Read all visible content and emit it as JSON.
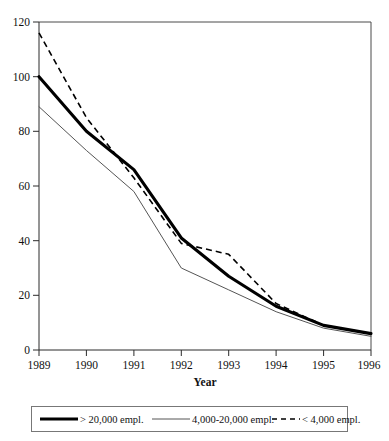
{
  "chart_data": {
    "type": "line",
    "title": "",
    "xlabel": "Year",
    "ylabel": "",
    "x": [
      1989,
      1990,
      1991,
      1992,
      1993,
      1994,
      1995,
      1996
    ],
    "xtick_labels": [
      "1989",
      "1990",
      "1991",
      "1992",
      "1993",
      "1994",
      "1995",
      "1996"
    ],
    "ytick_labels": [
      "0",
      "20",
      "40",
      "60",
      "80",
      "100",
      "120"
    ],
    "yticks": [
      0,
      20,
      40,
      60,
      80,
      100,
      120
    ],
    "ylim": [
      0,
      120
    ],
    "xlim": [
      1989,
      1996
    ],
    "grid": false,
    "legend_position": "bottom",
    "series": [
      {
        "name": "> 20,000 empl.",
        "style": "thick-solid",
        "color": "#000000",
        "values": [
          100,
          80,
          66,
          41,
          27,
          16,
          9,
          6
        ]
      },
      {
        "name": "4,000-20,000 empl.",
        "style": "thin-solid",
        "color": "#555555",
        "values": [
          89,
          73,
          58,
          30,
          22,
          14,
          8,
          5
        ]
      },
      {
        "name": "< 4,000 empl.",
        "style": "dashed",
        "color": "#000000",
        "values": [
          116,
          85,
          63,
          39,
          35,
          17,
          9,
          6
        ]
      }
    ]
  },
  "axes": {
    "y_ticks": [
      {
        "label": "120",
        "value": 120
      },
      {
        "label": "100",
        "value": 100
      },
      {
        "label": "80",
        "value": 80
      },
      {
        "label": "60",
        "value": 60
      },
      {
        "label": "40",
        "value": 40
      },
      {
        "label": "20",
        "value": 20
      },
      {
        "label": "0",
        "value": 0
      }
    ],
    "x_ticks": [
      {
        "label": "1989",
        "value": 1989
      },
      {
        "label": "1990",
        "value": 1990
      },
      {
        "label": "1991",
        "value": 1991
      },
      {
        "label": "1992",
        "value": 1992
      },
      {
        "label": "1993",
        "value": 1993
      },
      {
        "label": "1994",
        "value": 1994
      },
      {
        "label": "1995",
        "value": 1995
      },
      {
        "label": "1996",
        "value": 1996
      }
    ],
    "x_axis_title": "Year"
  },
  "legend": {
    "entries": [
      {
        "label": "> 20,000 empl.",
        "style": "thick-solid"
      },
      {
        "label": "4,000-20,000 empl.",
        "style": "thin-solid"
      },
      {
        "label": "< 4,000 empl.",
        "style": "dashed"
      }
    ]
  }
}
